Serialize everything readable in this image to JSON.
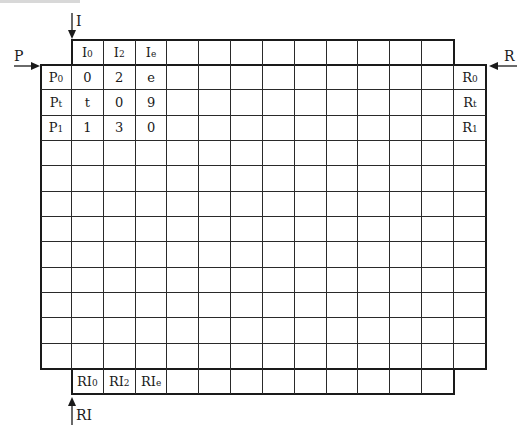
{
  "diagram": {
    "grid": {
      "rows": 12,
      "cols": 12
    },
    "arrows": {
      "I": {
        "label": "I",
        "direction": "down"
      },
      "P": {
        "label": "P",
        "direction": "right"
      },
      "R": {
        "label": "R",
        "direction": "left"
      },
      "RI": {
        "label": "RI",
        "direction": "up"
      }
    },
    "top_header": [
      {
        "base": "I",
        "sub": "0"
      },
      {
        "base": "I",
        "sub": "2"
      },
      {
        "base": "I",
        "sub": "e"
      }
    ],
    "bottom_header": [
      {
        "base": "RI",
        "sub": "0"
      },
      {
        "base": "RI",
        "sub": "2"
      },
      {
        "base": "RI",
        "sub": "e"
      }
    ],
    "left_header": [
      {
        "base": "P",
        "sub": "0"
      },
      {
        "base": "P",
        "sub": "t"
      },
      {
        "base": "P",
        "sub": "1"
      }
    ],
    "right_header": [
      {
        "base": "R",
        "sub": "0"
      },
      {
        "base": "R",
        "sub": "t"
      },
      {
        "base": "R",
        "sub": "1"
      }
    ],
    "cells": [
      [
        "0",
        "2",
        "e"
      ],
      [
        "t",
        "0",
        "9"
      ],
      [
        "1",
        "3",
        "0"
      ]
    ],
    "line_color": "#1a1a1a"
  }
}
